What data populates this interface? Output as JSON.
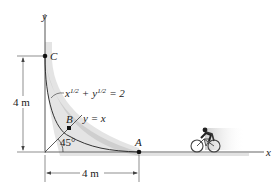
{
  "diagram": {
    "axes": {
      "x_label": "x",
      "y_label": "y"
    },
    "points": {
      "C": {
        "label": "C"
      },
      "B": {
        "label": "B"
      },
      "A": {
        "label": "A"
      }
    },
    "curve_equation": {
      "base_x": "x",
      "exp_x": "1/2",
      "plus": "+",
      "base_y": "y",
      "exp_y": "1/2",
      "rhs": "= 2"
    },
    "line_equation": "y = x",
    "angle_label": "45°",
    "dimensions": {
      "vertical": "4 m",
      "horizontal": "4 m"
    },
    "colors": {
      "ink": "#222222",
      "shade": "#bfbfbf",
      "axis": "#555555"
    }
  }
}
